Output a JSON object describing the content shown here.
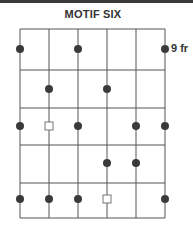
{
  "title": "MOTIF SIX",
  "fret_label": "9 fr",
  "colors": {
    "line": "#555555",
    "dot": "#3a3a3a",
    "open_marker": "#777777",
    "topbar": "#3a3a3a"
  },
  "grid": {
    "strings": 6,
    "frets": 5,
    "string_x": [
      20,
      49,
      78,
      107,
      136,
      165
    ],
    "fret_y": [
      29,
      70,
      108,
      145,
      183,
      218
    ]
  },
  "markers": [
    {
      "type": "dot",
      "string": 1,
      "row": 1
    },
    {
      "type": "dot",
      "string": 3,
      "row": 1
    },
    {
      "type": "dot",
      "string": 6,
      "row": 1
    },
    {
      "type": "dot",
      "string": 2,
      "row": 2
    },
    {
      "type": "dot",
      "string": 4,
      "row": 2
    },
    {
      "type": "dot",
      "string": 1,
      "row": 3
    },
    {
      "type": "square",
      "string": 2,
      "row": 3
    },
    {
      "type": "dot",
      "string": 3,
      "row": 3
    },
    {
      "type": "dot",
      "string": 5,
      "row": 3
    },
    {
      "type": "dot",
      "string": 6,
      "row": 3
    },
    {
      "type": "dot",
      "string": 4,
      "row": 4
    },
    {
      "type": "dot",
      "string": 5,
      "row": 4
    },
    {
      "type": "dot",
      "string": 1,
      "row": 5
    },
    {
      "type": "dot",
      "string": 2,
      "row": 5
    },
    {
      "type": "dot",
      "string": 3,
      "row": 5
    },
    {
      "type": "square",
      "string": 4,
      "row": 5
    },
    {
      "type": "dot",
      "string": 6,
      "row": 5
    }
  ],
  "row_y": [
    49,
    89,
    126,
    163,
    199
  ]
}
